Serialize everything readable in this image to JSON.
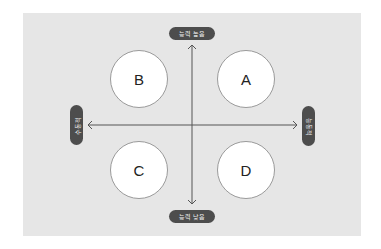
{
  "diagram": {
    "type": "quadrant-matrix",
    "axis_labels": {
      "top": "능력 높음",
      "bottom": "능력 낮음",
      "left": "수동적",
      "right": "능동적"
    },
    "quadrants": {
      "top_left": "B",
      "top_right": "A",
      "bottom_left": "C",
      "bottom_right": "D"
    },
    "colors": {
      "background": "#e6e6e6",
      "pill": "#4d4d4d",
      "pill_text": "#f2f2f2",
      "axis": "#555555",
      "circle_fill": "#ffffff",
      "circle_border": "#9a9a9a"
    }
  }
}
